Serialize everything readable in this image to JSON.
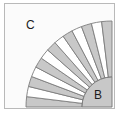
{
  "figure": {
    "width": 121,
    "height": 118,
    "background_color": "#fbfbfb",
    "frame": {
      "border_color": "#b9b9b9",
      "border_width": 1,
      "x": 4,
      "y": 3,
      "width": 111,
      "height": 106
    }
  },
  "labels": {
    "outer_region": "C",
    "inner_region": "B"
  },
  "chart_data": {
    "type": "pie",
    "center": [
      111,
      106
    ],
    "inner_disc_radius": 30,
    "annulus_inner_radius": 30,
    "annulus_outer_radius": 86,
    "angle_start_deg": 180,
    "angle_end_deg": 270,
    "sector_count": 13,
    "sector_angle_deg": 6.923,
    "categories": [
      "s1",
      "s2",
      "s3",
      "s4",
      "s5",
      "s6",
      "s7",
      "s8",
      "s9",
      "s10",
      "s11",
      "s12",
      "s13"
    ],
    "values": [
      6.923,
      6.923,
      6.923,
      6.923,
      6.923,
      6.923,
      6.923,
      6.923,
      6.923,
      6.923,
      6.923,
      6.923,
      6.923
    ],
    "fills": [
      "#c8c8c8",
      "#ffffff",
      "#c8c8c8",
      "#ffffff",
      "#c8c8c8",
      "#ffffff",
      "#c8c8c8",
      "#ffffff",
      "#c8c8c8",
      "#ffffff",
      "#c8c8c8",
      "#ffffff",
      "#c8c8c8"
    ],
    "legend": [
      "B",
      "C"
    ],
    "legend_position": "inline-annotations",
    "grid": false,
    "xlabel": "",
    "ylabel": ""
  },
  "colors": {
    "sector_gray": "#c8c8c8",
    "sector_white": "#ffffff",
    "inner_disc": "#c8c8c8",
    "stroke": "#7d7d7d",
    "background": "#fbfbfb",
    "frame_border": "#b9b9b9",
    "text": "#1c1c1c"
  }
}
